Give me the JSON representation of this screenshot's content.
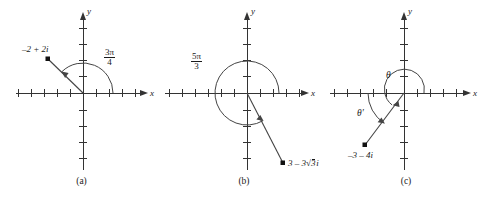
{
  "figure": {
    "type": "math-diagram",
    "panel_count": 3,
    "stroke_color": "#333333",
    "text_color": "#1a1a1a"
  },
  "panels": [
    {
      "id": "a",
      "caption": "(a)",
      "axis_x_label": "x",
      "axis_y_label": "y",
      "point_label": "–2 + 2i",
      "point": {
        "x": -2,
        "y": 2
      },
      "angle_numerator": "3π",
      "angle_denominator": "4",
      "angle_value_text": "3π/4",
      "angle_degrees": 135,
      "arc_direction": "counterclockwise",
      "x_ticks": 11,
      "y_ticks": 9
    },
    {
      "id": "b",
      "caption": "(b)",
      "axis_x_label": "x",
      "axis_y_label": "y",
      "point_label_a": "3 – 3",
      "point_label_radicand": "3",
      "point_label_b": "i",
      "point_label_full": "3 – 3√3 i",
      "point": {
        "x": 3,
        "y": -5.2
      },
      "angle_numerator": "5π",
      "angle_denominator": "3",
      "angle_value_text": "5π/3",
      "angle_degrees": 300,
      "arc_direction": "counterclockwise",
      "x_ticks": 11,
      "y_ticks": 9
    },
    {
      "id": "c",
      "caption": "(c)",
      "axis_x_label": "x",
      "axis_y_label": "y",
      "point_label": "–3 – 4i",
      "point": {
        "x": -3,
        "y": -4
      },
      "angle_label": "θ",
      "reference_angle_label": "θ′",
      "angle_degrees": 233,
      "reference_angle_degrees": 53,
      "arc_direction": "counterclockwise",
      "x_ticks": 11,
      "y_ticks": 9
    }
  ]
}
